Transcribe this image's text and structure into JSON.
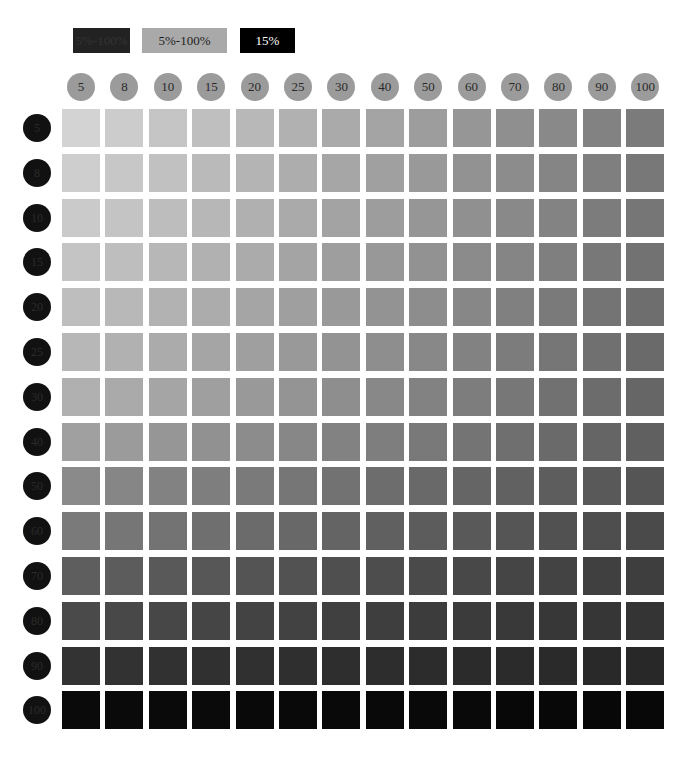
{
  "legend": [
    {
      "label": "5%-100%",
      "bg": "#222222",
      "fg": "#333333",
      "left": 73,
      "width": 57
    },
    {
      "label": "5%-100%",
      "bg": "#a9a9a9",
      "fg": "#1e1e1e",
      "left": 142,
      "width": 85
    },
    {
      "label": "15%",
      "bg": "#000000",
      "fg": "#ffffff",
      "left": 240,
      "width": 55
    }
  ],
  "columns": [
    "5",
    "8",
    "10",
    "15",
    "20",
    "25",
    "30",
    "40",
    "50",
    "60",
    "70",
    "80",
    "90",
    "100"
  ],
  "rows": [
    "5",
    "8",
    "10",
    "15",
    "20",
    "25",
    "30",
    "40",
    "50",
    "60",
    "70",
    "80",
    "90",
    "100"
  ],
  "grid": {
    "row_base": [
      211,
      206,
      202,
      196,
      190,
      183,
      176,
      160,
      138,
      122,
      94,
      74,
      51,
      10
    ],
    "col_drop": [
      0,
      2,
      4,
      7,
      10,
      14,
      18,
      24,
      30,
      36,
      42,
      48,
      54,
      88
    ],
    "row_last": [
      123,
      120,
      118,
      114,
      110,
      106,
      102,
      96,
      85,
      74,
      62,
      52,
      40,
      8
    ]
  }
}
